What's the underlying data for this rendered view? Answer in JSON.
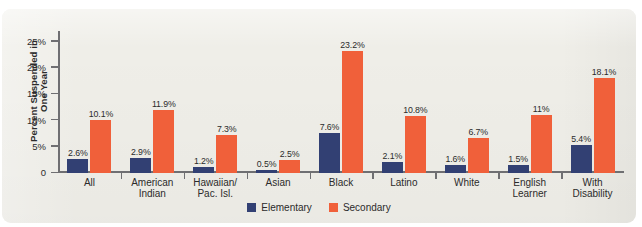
{
  "chart_data": {
    "type": "bar",
    "title": "",
    "xlabel": "",
    "ylabel": "Percent Suspended in One Year",
    "ylabel_line1": "Percent Suspended in",
    "ylabel_line2": "One Year",
    "ylim": [
      0,
      27
    ],
    "ytick_values": [
      0,
      5,
      10,
      15,
      20,
      25
    ],
    "ytick_labels": [
      "0",
      "5%",
      "10%",
      "15%",
      "20%",
      "25%"
    ],
    "grid": false,
    "legend_position": "bottom-center",
    "categories": [
      "All",
      "American\nIndian",
      "Hawaiian/\nPac. Isl.",
      "Asian",
      "Black",
      "Latino",
      "White",
      "English\nLearner",
      "With\nDisability"
    ],
    "series": [
      {
        "name": "Elementary",
        "color": "#324073",
        "values": [
          2.6,
          2.9,
          1.2,
          0.5,
          7.6,
          2.1,
          1.6,
          1.5,
          5.4
        ],
        "labels": [
          "2.6%",
          "2.9%",
          "1.2%",
          "0.5%",
          "7.6%",
          "2.1%",
          "1.6%",
          "1.5%",
          "5.4%"
        ]
      },
      {
        "name": "Secondary",
        "color": "#f0603a",
        "values": [
          10.1,
          11.9,
          7.3,
          2.5,
          23.2,
          10.8,
          6.7,
          11.0,
          18.1
        ],
        "labels": [
          "10.1%",
          "11.9%",
          "7.3%",
          "2.5%",
          "23.2%",
          "10.8%",
          "6.7%",
          "11%",
          "18.1%"
        ]
      }
    ]
  },
  "legend": {
    "items": [
      {
        "label": "Elementary",
        "color": "#324073"
      },
      {
        "label": "Secondary",
        "color": "#f0603a"
      }
    ]
  },
  "colors": {
    "panel_background": "#efeee8",
    "elementary": "#324073",
    "secondary": "#f0603a",
    "axis": "#6f6f72",
    "text": "#2b2b2b"
  }
}
